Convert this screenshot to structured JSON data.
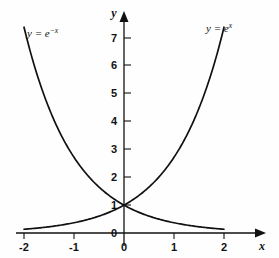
{
  "chart_data": {
    "type": "line",
    "title": "",
    "subtitle": "",
    "xlabel": "x",
    "ylabel": "y",
    "xlim": [
      -2.25,
      2.45
    ],
    "ylim": [
      -0.45,
      7.9
    ],
    "grid": false,
    "legend_position": "inline-curve-labels",
    "x_ticks": [
      "-2",
      "-1",
      "0",
      "1",
      "2"
    ],
    "x_tick_values": [
      -2,
      -1,
      0,
      1,
      2
    ],
    "y_ticks": [
      "0",
      "1",
      "2",
      "3",
      "4",
      "5",
      "6",
      "7"
    ],
    "y_tick_values": [
      0,
      1,
      2,
      3,
      4,
      5,
      6,
      7
    ],
    "series": [
      {
        "name": "y = e^x",
        "label_base": "y = e",
        "label_exponent": "x",
        "x": [
          -2,
          -1.75,
          -1.5,
          -1.25,
          -1,
          -0.75,
          -0.5,
          -0.25,
          0,
          0.25,
          0.5,
          0.75,
          1,
          1.25,
          1.5,
          1.75,
          2
        ],
        "values": [
          0.135,
          0.174,
          0.223,
          0.287,
          0.368,
          0.472,
          0.607,
          0.779,
          1,
          1.284,
          1.649,
          2.117,
          2.718,
          3.49,
          4.482,
          5.755,
          7.389
        ]
      },
      {
        "name": "y = e^-x",
        "label_base": "y = e",
        "label_exponent": "-x",
        "x": [
          -2,
          -1.75,
          -1.5,
          -1.25,
          -1,
          -0.75,
          -0.5,
          -0.25,
          0,
          0.25,
          0.5,
          0.75,
          1,
          1.25,
          1.5,
          1.75,
          2
        ],
        "values": [
          7.389,
          5.755,
          4.482,
          3.49,
          2.718,
          2.117,
          1.649,
          1.284,
          1,
          0.779,
          0.607,
          0.472,
          0.368,
          0.287,
          0.223,
          0.174,
          0.135
        ]
      }
    ],
    "annotations": [
      {
        "text": "y = e^-x",
        "x": -1.55,
        "y": 6.6
      },
      {
        "text": "y = e^x",
        "x": 1.35,
        "y": 7.0
      }
    ],
    "intersection_point": {
      "x": 0,
      "y": 1
    },
    "colors": {
      "curve": "#111111",
      "axis": "#111111",
      "background": "#fefefe"
    }
  },
  "labels": {
    "axis_x": "x",
    "axis_y": "y",
    "x_tick_neg2": "-2",
    "x_tick_neg1": "-1",
    "x_tick_0": "0",
    "x_tick_1": "1",
    "x_tick_2": "2",
    "y_tick_0": "0",
    "y_tick_1": "1",
    "y_tick_2": "2",
    "y_tick_3": "3",
    "y_tick_4": "4",
    "y_tick_5": "5",
    "y_tick_6": "6",
    "y_tick_7": "7",
    "curve_left_base": "y = e",
    "curve_left_exp": "−x",
    "curve_right_base": "y = e",
    "curve_right_exp": "x"
  }
}
